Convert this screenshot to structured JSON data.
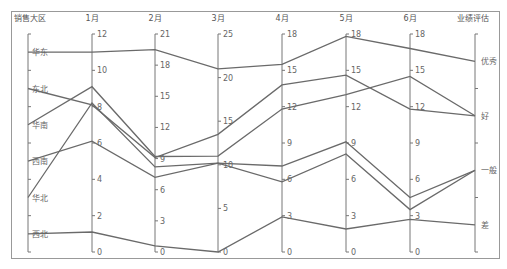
{
  "chart_data": {
    "type": "parallel_coordinates",
    "title": "",
    "axes": [
      {
        "name": "销售大区",
        "type": "category",
        "categories": [
          "西北",
          "华北",
          "西南",
          "华南",
          "东北",
          "华东"
        ]
      },
      {
        "name": "1月",
        "type": "value",
        "min": 0,
        "max": 12,
        "ticks": [
          0,
          2,
          4,
          6,
          8,
          10,
          12
        ]
      },
      {
        "name": "2月",
        "type": "value",
        "min": 0,
        "max": 21,
        "ticks": [
          0,
          3,
          6,
          9,
          12,
          15,
          18,
          21
        ]
      },
      {
        "name": "3月",
        "type": "value",
        "min": 0,
        "max": 25,
        "ticks": [
          0,
          5,
          10,
          15,
          20,
          25
        ]
      },
      {
        "name": "4月",
        "type": "value",
        "min": 0,
        "max": 18,
        "ticks": [
          0,
          3,
          6,
          9,
          12,
          15,
          18
        ]
      },
      {
        "name": "5月",
        "type": "value",
        "min": 0,
        "max": 18,
        "ticks": [
          0,
          3,
          6,
          9,
          12,
          15,
          18
        ]
      },
      {
        "name": "6月",
        "type": "value",
        "min": 0,
        "max": 18,
        "ticks": [
          0,
          3,
          6,
          9,
          12,
          15,
          18
        ]
      },
      {
        "name": "业绩评估",
        "type": "category",
        "categories": [
          "差",
          "一般",
          "好",
          "优秀"
        ]
      }
    ],
    "series": [
      {
        "name": "华东",
        "values": [
          "华东",
          11,
          19.5,
          21,
          15.5,
          17.8,
          16.8,
          "优秀"
        ]
      },
      {
        "name": "东北",
        "values": [
          "东北",
          8.1,
          9.1,
          13.5,
          13.8,
          14.6,
          11.8,
          "好"
        ]
      },
      {
        "name": "华南",
        "values": [
          "华南",
          9.1,
          9.2,
          11,
          11.8,
          13,
          14.5,
          "好"
        ]
      },
      {
        "name": "西南",
        "values": [
          "西南",
          6.1,
          7.2,
          10.2,
          5.8,
          8.1,
          3.5,
          "一般"
        ]
      },
      {
        "name": "华北",
        "values": [
          "华北",
          8.2,
          8.2,
          10.2,
          7.1,
          9.1,
          4.5,
          "一般"
        ]
      },
      {
        "name": "西北",
        "values": [
          "西北",
          1.1,
          0.6,
          0,
          2.9,
          1.9,
          2.7,
          "差"
        ]
      }
    ],
    "line_color": "#6a6a6a"
  }
}
